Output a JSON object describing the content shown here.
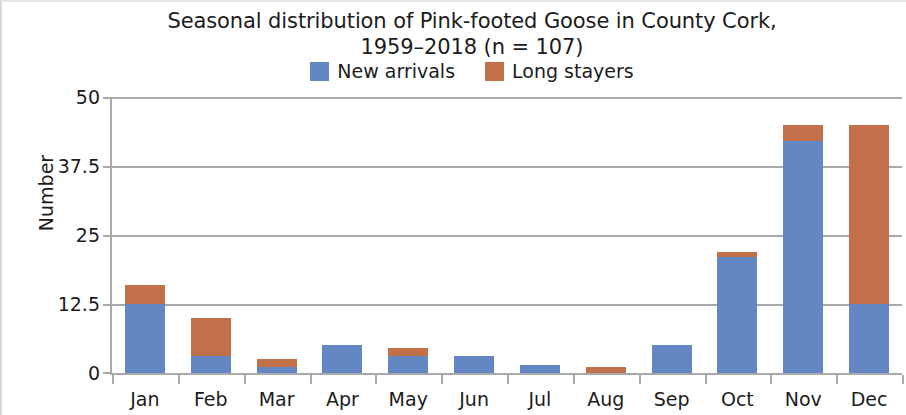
{
  "chart_data": {
    "type": "bar",
    "subtype": "stacked",
    "title": "Seasonal distribution of Pink-footed Goose in County Cork, 1959–2018 (n = 107)",
    "title_line_1": "Seasonal distribution of Pink-footed Goose in County Cork,",
    "title_line_2": "1959–2018 (n = 107)",
    "xlabel": "",
    "ylabel": "Number",
    "categories": [
      "Jan",
      "Feb",
      "Mar",
      "Apr",
      "May",
      "Jun",
      "Jul",
      "Aug",
      "Sep",
      "Oct",
      "Nov",
      "Dec"
    ],
    "ylim": [
      0,
      50
    ],
    "yticks": [
      0,
      12.5,
      25,
      37.5,
      50
    ],
    "ytick_labels": [
      "0",
      "12.5",
      "25",
      "37.5",
      "50"
    ],
    "grid": true,
    "grid_axis": "y",
    "legend_position": "top-center",
    "series": [
      {
        "name": "New arrivals",
        "color": "#6487c4",
        "values": [
          12.5,
          3,
          1,
          5,
          3,
          3,
          1.5,
          0,
          5,
          21,
          42,
          12.5
        ]
      },
      {
        "name": "Long stayers",
        "color": "#c2704a",
        "values": [
          3.5,
          7,
          1.5,
          0,
          1.5,
          0,
          0,
          1,
          0,
          1,
          3,
          32.5
        ]
      }
    ],
    "totals": [
      16,
      10,
      2.5,
      5,
      4.5,
      3,
      1.5,
      1,
      5,
      22,
      45,
      45
    ]
  },
  "legend": {
    "items": [
      {
        "label": "New arrivals",
        "color": "#6487c4",
        "swatch": "legend-swatch-blue"
      },
      {
        "label": "Long stayers",
        "color": "#c2704a",
        "swatch": "legend-swatch-orange"
      }
    ]
  },
  "axes": {
    "y_title": "Number",
    "y_tick_labels": [
      "50",
      "37.5",
      "25",
      "12.5",
      "0"
    ],
    "x_tick_labels": [
      "Jan",
      "Feb",
      "Mar",
      "Apr",
      "May",
      "Jun",
      "Jul",
      "Aug",
      "Sep",
      "Oct",
      "Nov",
      "Dec"
    ]
  },
  "colors": {
    "series_new_arrivals": "#6487c4",
    "series_long_stayers": "#c2704a",
    "axis": "#a9a9a9",
    "text": "#1c1c1c",
    "background": "#ffffff"
  }
}
